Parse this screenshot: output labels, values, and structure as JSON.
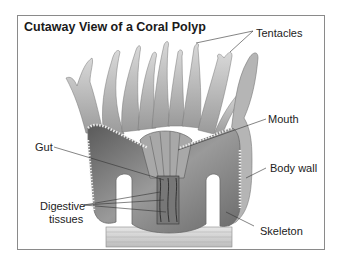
{
  "title": "Cutaway View of a Coral Polyp",
  "labels": {
    "tentacles": "Tentacles",
    "mouth": "Mouth",
    "gut": "Gut",
    "body_wall": "Body wall",
    "digestive_line1": "Digestive",
    "digestive_line2": "tissues",
    "skeleton": "Skeleton"
  }
}
